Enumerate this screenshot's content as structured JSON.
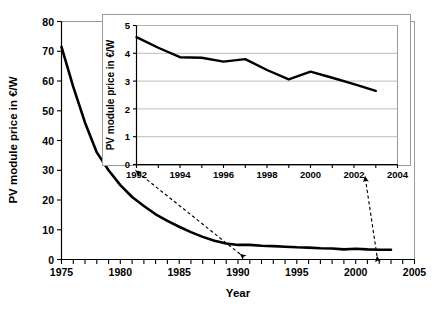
{
  "chart_data": [
    {
      "id": "main",
      "type": "line",
      "title": "",
      "xlabel": "Year",
      "ylabel": "PV module price in €/W",
      "xlim": [
        1975,
        2005
      ],
      "ylim": [
        0,
        80
      ],
      "ytick_step": 10,
      "xtick_step": 1,
      "xtick_label_step": 5,
      "xticklabels": [
        "1975",
        "1980",
        "1985",
        "1990",
        "1995",
        "2000",
        "2005"
      ],
      "yticklabels": [
        "0",
        "10",
        "20",
        "30",
        "40",
        "50",
        "60",
        "70",
        "80"
      ],
      "grid": false,
      "legend": "none",
      "line_color": "#000000",
      "x": [
        1975,
        1976,
        1977,
        1978,
        1979,
        1980,
        1981,
        1982,
        1983,
        1984,
        1985,
        1986,
        1987,
        1988,
        1989,
        1990,
        1991,
        1992,
        1993,
        1994,
        1995,
        1996,
        1997,
        1998,
        1999,
        2000,
        2001,
        2002,
        2003
      ],
      "values": [
        71.5,
        58.0,
        46.0,
        36.0,
        30.0,
        25.0,
        21.0,
        18.0,
        15.2,
        13.0,
        11.0,
        9.2,
        7.6,
        6.3,
        5.4,
        4.9,
        4.9,
        4.6,
        4.5,
        4.3,
        4.1,
        4.0,
        3.8,
        3.7,
        3.4,
        3.6,
        3.4,
        3.3,
        3.3
      ]
    },
    {
      "id": "inset",
      "type": "line",
      "title": "",
      "xlabel": "",
      "ylabel": "PV module price in €/W",
      "xlim": [
        1992,
        2004
      ],
      "ylim": [
        0,
        5
      ],
      "ytick_step": 1,
      "xtick_step": 1,
      "xtick_label_step": 2,
      "xticklabels": [
        "1992",
        "1994",
        "1996",
        "1998",
        "2000",
        "2002",
        "2004"
      ],
      "yticklabels": [
        "0",
        "1",
        "2",
        "3",
        "4",
        "5"
      ],
      "grid": true,
      "legend": "none",
      "line_color": "#000000",
      "x": [
        1992,
        1993,
        1994,
        1995,
        1996,
        1997,
        1998,
        1999,
        2000,
        2001,
        2002,
        2003
      ],
      "values": [
        4.58,
        4.2,
        3.86,
        3.84,
        3.7,
        3.79,
        3.4,
        3.06,
        3.34,
        3.12,
        2.89,
        2.65
      ]
    }
  ],
  "annotations": {
    "connector_left": "dashed-double-arrow-left",
    "connector_right": "dashed-double-arrow-right"
  },
  "colors": {
    "line": "#000000",
    "frame": "#9a9a9a",
    "grid": "#b5b5b5",
    "axis": "#000000",
    "background": "#ffffff"
  }
}
